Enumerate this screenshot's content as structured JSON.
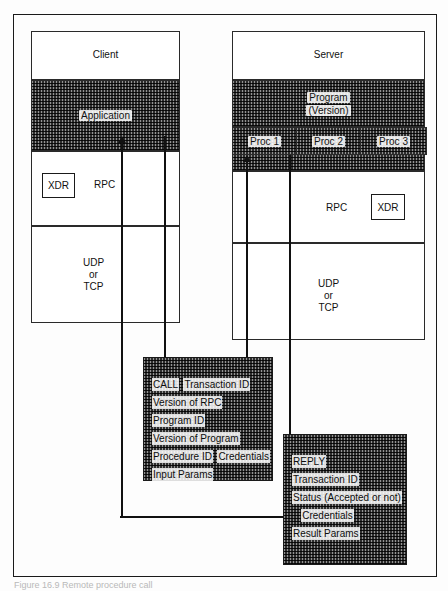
{
  "figure": {
    "caption": "Figure 16.9  Remote procedure call",
    "colors": {
      "ink": "#111111",
      "frame": "#1a1a1a",
      "paper": "#ffffff"
    }
  },
  "client": {
    "title": "Client",
    "application_label": "Application",
    "xdr_label": "XDR",
    "rpc_label": "RPC",
    "transport": {
      "line1": "UDP",
      "line2": "or",
      "line3": "TCP"
    }
  },
  "server": {
    "title": "Server",
    "program_label_line1": "Program",
    "program_label_line2": "(Version)",
    "procedures": [
      {
        "label": "Proc 1"
      },
      {
        "label": "Proc 2"
      },
      {
        "label": "Proc 3"
      }
    ],
    "rpc_label": "RPC",
    "xdr_label": "XDR",
    "transport": {
      "line1": "UDP",
      "line2": "or",
      "line3": "TCP"
    }
  },
  "call_packet": {
    "title": "CALL",
    "fields": [
      "CALL",
      "Transaction ID",
      "Version of RPC",
      "Program ID",
      "Version of Program",
      "Procedure ID",
      "Credentials",
      "Input Params"
    ]
  },
  "reply_packet": {
    "title": "REPLY",
    "fields": [
      "REPLY",
      "",
      "Transaction ID",
      "Status (Accepted or not)",
      "",
      "Credentials",
      "Result Params"
    ]
  }
}
